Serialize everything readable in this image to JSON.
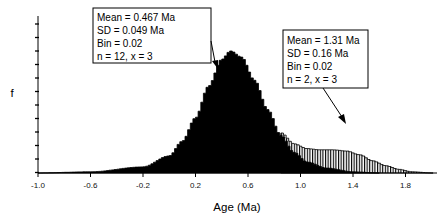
{
  "chart_data": {
    "type": "area",
    "title": "",
    "xlabel": "Age (Ma)",
    "ylabel": "f",
    "xlim": [
      -1.0,
      2.0
    ],
    "x_ticks": [
      -1.0,
      -0.6,
      -0.2,
      0.2,
      0.6,
      1.0,
      1.4,
      1.8
    ],
    "x_tick_labels": [
      "-1.0",
      "-0.6",
      "-0.2",
      "0.2",
      "0.6",
      "1.0",
      "1.4",
      "1.8"
    ],
    "y_tick_count": 12,
    "y_tick_labels": [],
    "grid": false,
    "legend": null,
    "series": [
      {
        "name": "Population 1 (probability density, solid fill)",
        "fill": "solid-black",
        "mean": 0.467,
        "sd": 0.049,
        "bin": 0.02,
        "n": 12,
        "x_factor": 3,
        "points": [
          {
            "x": -1.0,
            "y": 0.0
          },
          {
            "x": -0.6,
            "y": 0.01
          },
          {
            "x": -0.2,
            "y": 0.05
          },
          {
            "x": 0.0,
            "y": 0.14
          },
          {
            "x": 0.1,
            "y": 0.26
          },
          {
            "x": 0.2,
            "y": 0.45
          },
          {
            "x": 0.3,
            "y": 0.71
          },
          {
            "x": 0.4,
            "y": 0.93
          },
          {
            "x": 0.467,
            "y": 1.0
          },
          {
            "x": 0.55,
            "y": 0.95
          },
          {
            "x": 0.65,
            "y": 0.76
          },
          {
            "x": 0.75,
            "y": 0.52
          },
          {
            "x": 0.85,
            "y": 0.31
          },
          {
            "x": 0.95,
            "y": 0.17
          },
          {
            "x": 1.05,
            "y": 0.09
          },
          {
            "x": 1.2,
            "y": 0.04
          },
          {
            "x": 1.4,
            "y": 0.01
          },
          {
            "x": 1.6,
            "y": 0.0
          }
        ]
      },
      {
        "name": "Population 2 (summed density, hatched fill)",
        "fill": "vertical-hatch",
        "mean": 1.31,
        "sd": 0.16,
        "bin": 0.02,
        "n": 2,
        "x_factor": 3,
        "points": [
          {
            "x": 0.85,
            "y": 0.33
          },
          {
            "x": 0.95,
            "y": 0.24
          },
          {
            "x": 1.05,
            "y": 0.2
          },
          {
            "x": 1.15,
            "y": 0.19
          },
          {
            "x": 1.25,
            "y": 0.19
          },
          {
            "x": 1.35,
            "y": 0.18
          },
          {
            "x": 1.45,
            "y": 0.15
          },
          {
            "x": 1.55,
            "y": 0.1
          },
          {
            "x": 1.65,
            "y": 0.06
          },
          {
            "x": 1.75,
            "y": 0.03
          },
          {
            "x": 1.85,
            "y": 0.01
          },
          {
            "x": 2.0,
            "y": 0.0
          }
        ]
      }
    ],
    "annotations": [
      {
        "id": "peak-1",
        "lines": [
          "Mean = 0.467 Ma",
          "SD = 0.049 Ma",
          "Bin = 0.02",
          "n = 12, x = 3"
        ],
        "arrow_target_x": 0.44
      },
      {
        "id": "peak-2",
        "lines": [
          "Mean = 1.31 Ma",
          "SD = 0.16 Ma",
          "Bin = 0.02",
          "n = 2, x = 3"
        ],
        "arrow_target_x": 1.33
      }
    ]
  },
  "labels": {
    "xlabel": "Age (Ma)",
    "ylabel": "f",
    "ann1": [
      "Mean = 0.467 Ma",
      "SD = 0.049 Ma",
      "Bin = 0.02",
      "n = 12, x = 3"
    ],
    "ann2": [
      "Mean = 1.31 Ma",
      "SD = 0.16 Ma",
      "Bin = 0.02",
      "n = 2, x = 3"
    ],
    "ticks": [
      "-1.0",
      "-0.6",
      "-0.2",
      "0.2",
      "0.6",
      "1.0",
      "1.4",
      "1.8"
    ]
  }
}
